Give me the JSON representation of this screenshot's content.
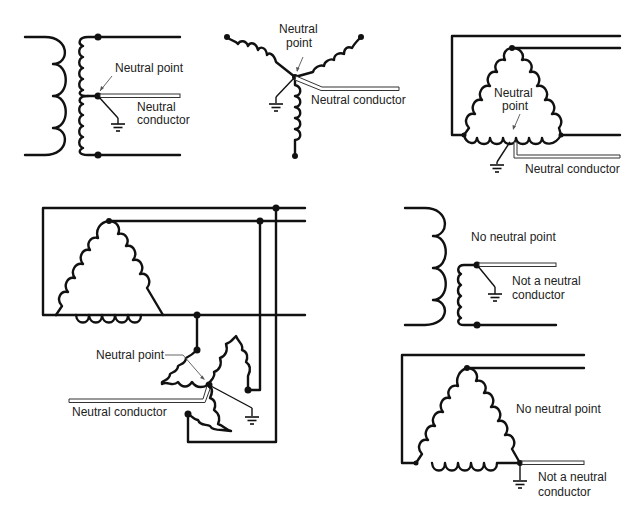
{
  "figure": {
    "panels": [
      {
        "id": "single-phase-center-tap",
        "labels": {
          "neutral_point": "Neutral point",
          "neutral_conductor_1": "Neutral",
          "neutral_conductor_2": "conductor"
        }
      },
      {
        "id": "wye-connection",
        "labels": {
          "neutral_point_1": "Neutral",
          "neutral_point_2": "point",
          "neutral_conductor": "Neutral conductor"
        }
      },
      {
        "id": "delta-center-tapped",
        "labels": {
          "neutral_point_1": "Neutral",
          "neutral_point_2": "point",
          "neutral_conductor": "Neutral conductor"
        }
      },
      {
        "id": "delta-with-zigzag",
        "labels": {
          "neutral_point": "Neutral point",
          "neutral_conductor": "Neutral conductor"
        }
      },
      {
        "id": "single-phase-corner",
        "labels": {
          "no_neutral": "No neutral point",
          "not_neutral_1": "Not a neutral",
          "not_neutral_2": "conductor"
        }
      },
      {
        "id": "delta-corner-grounded",
        "labels": {
          "no_neutral": "No neutral point",
          "not_neutral_1": "Not a neutral",
          "not_neutral_2": "conductor"
        }
      }
    ]
  }
}
